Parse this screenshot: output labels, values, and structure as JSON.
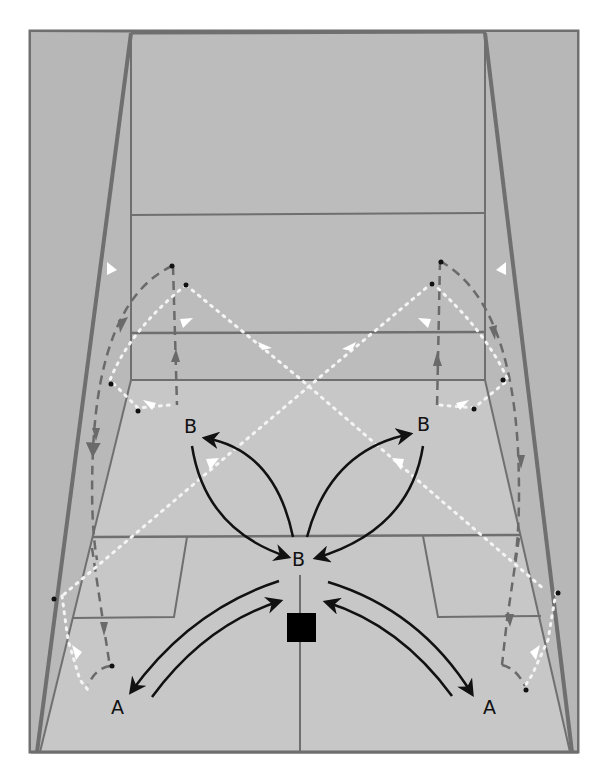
{
  "diagram": {
    "colors": {
      "frame_bg": "#ffffff",
      "wall": "#b9b9b9",
      "side_wall_shade": "#b0b0b0",
      "floor": "#c6c6c6",
      "front_wall": "#bdbdbd",
      "court_line": "#6f6f6f",
      "player_path": "#111111",
      "ball_path_dotted": "#f2f2f2",
      "dashed_path": "#6a6a6a",
      "marker": "#000000"
    },
    "labels": {
      "b_left": "B",
      "b_right": "B",
      "b_center": "B",
      "a_left": "A",
      "a_right": "A"
    },
    "legend": {
      "solid_black_arrows": "player movement",
      "white_dotted_arrows": "ball path",
      "grey_dashed_arrows": "ball path off walls",
      "black_square": "T position marker"
    }
  }
}
